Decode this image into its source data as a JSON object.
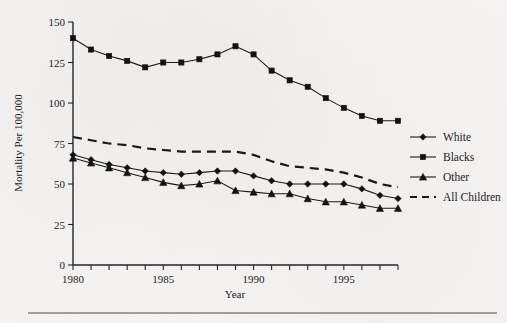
{
  "chart_data": {
    "type": "line",
    "title": "",
    "xlabel": "Year",
    "ylabel": "Mortality Per 100,000",
    "xlim": [
      1980,
      1998
    ],
    "ylim": [
      0,
      150
    ],
    "ytick_values": [
      0,
      25,
      50,
      75,
      100,
      125,
      150
    ],
    "ytick_labels": [
      "0",
      "25",
      "50",
      "75",
      "100",
      "125",
      "150"
    ],
    "xtick_values": [
      1980,
      1981,
      1982,
      1983,
      1984,
      1985,
      1986,
      1987,
      1988,
      1989,
      1990,
      1991,
      1992,
      1993,
      1994,
      1995,
      1996,
      1997,
      1998
    ],
    "xtick_labels_shown": [
      "1980",
      "1985",
      "1990",
      "1995"
    ],
    "xtick_labels_shown_values": [
      1980,
      1985,
      1990,
      1995
    ],
    "grid": false,
    "legend_position": "right",
    "x": [
      1980,
      1981,
      1982,
      1983,
      1984,
      1985,
      1986,
      1987,
      1988,
      1989,
      1990,
      1991,
      1992,
      1993,
      1994,
      1995,
      1996,
      1997,
      1998
    ],
    "series": [
      {
        "name": "White",
        "marker": "diamond",
        "style": "solid",
        "values": [
          68,
          65,
          62,
          60,
          58,
          57,
          56,
          57,
          58,
          58,
          55,
          52,
          50,
          50,
          50,
          50,
          47,
          43,
          41
        ]
      },
      {
        "name": "Blacks",
        "marker": "square",
        "style": "solid",
        "values": [
          140,
          133,
          129,
          126,
          122,
          125,
          125,
          127,
          130,
          135,
          130,
          120,
          114,
          110,
          103,
          97,
          92,
          89,
          89
        ]
      },
      {
        "name": "Other",
        "marker": "triangle",
        "style": "solid",
        "values": [
          66,
          63,
          60,
          57,
          54,
          51,
          49,
          50,
          52,
          46,
          45,
          44,
          44,
          41,
          39,
          39,
          37,
          35,
          35
        ]
      },
      {
        "name": "All Children",
        "marker": "none",
        "style": "dashed",
        "values": [
          79,
          77,
          75,
          74,
          72,
          71,
          70,
          70,
          70,
          70,
          68,
          64,
          61,
          60,
          59,
          57,
          54,
          50,
          48
        ]
      }
    ]
  },
  "legend": {
    "entries": [
      {
        "label": "White",
        "marker": "diamond",
        "style": "solid"
      },
      {
        "label": "Blacks",
        "marker": "square",
        "style": "solid"
      },
      {
        "label": "Other",
        "marker": "triangle",
        "style": "solid"
      },
      {
        "label": "All Children",
        "marker": "none",
        "style": "dashed"
      }
    ]
  },
  "axes": {
    "x_title": "Year",
    "y_title": "Mortality Per 100,000"
  },
  "colors": {
    "ink": "#1a1a1a",
    "paper": "#f4f3f1",
    "rule": "#4a4a52"
  }
}
